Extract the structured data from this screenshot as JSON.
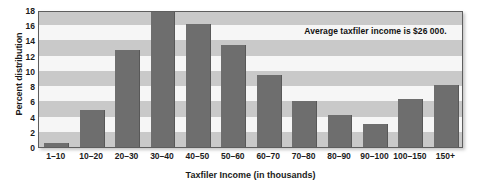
{
  "chart_data": {
    "type": "bar",
    "title": "",
    "xlabel": "Taxfiler Income (in thousands)",
    "ylabel": "Percent distribution",
    "categories": [
      "1–10",
      "10–20",
      "20–30",
      "30–40",
      "40–50",
      "50–60",
      "60–70",
      "70–80",
      "80–90",
      "90–100",
      "100–150",
      "150+"
    ],
    "values": [
      0.5,
      4.8,
      12.7,
      17.8,
      16.2,
      13.4,
      9.4,
      6.0,
      4.2,
      3.0,
      6.3,
      8.2
    ],
    "ylim": [
      0,
      18
    ],
    "ytick_step": 2,
    "yticks": [
      18,
      16,
      14,
      12,
      10,
      8,
      6,
      4,
      2,
      0
    ],
    "grid": "alternating-horizontal-bands",
    "legend": "none",
    "annotations": [
      {
        "text": "Average taxfiler income is $26 000.",
        "x_category": "90–100",
        "y_value": 15.2
      }
    ],
    "colors": {
      "bar": "#6e6e6e",
      "band_dark": "#c9c9c9",
      "band_light": "#f6f6f6",
      "frame": "#5e5e5e",
      "text": "#1b1b1b"
    }
  }
}
